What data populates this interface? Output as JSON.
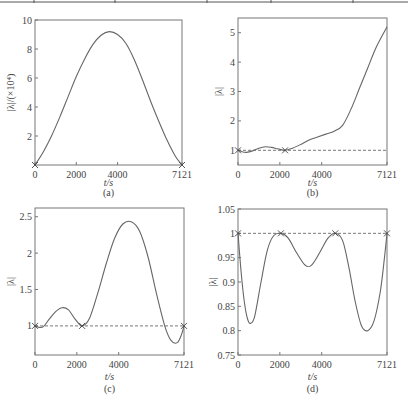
{
  "figure": {
    "top_table_rule": true
  },
  "chart_data": [
    {
      "id": "a",
      "type": "line",
      "panel_label": "(a)",
      "title": "",
      "xlabel": "t/s",
      "ylabel": "|λ|/(×10⁴)",
      "xlim": [
        0,
        7121
      ],
      "ylim": [
        0,
        10
      ],
      "xticks": [
        0,
        2000,
        4000,
        7121
      ],
      "xtick_labels": [
        "0",
        "2000",
        "4000",
        "7121"
      ],
      "yticks": [
        2,
        4,
        6,
        8,
        10
      ],
      "ytick_labels": [
        "2",
        "4",
        "6",
        "8",
        "10"
      ],
      "grid": false,
      "reference_line": null,
      "markers": [
        {
          "x": 0,
          "y": 0
        },
        {
          "x": 7121,
          "y": 0
        }
      ],
      "series": [
        {
          "name": "|λ|",
          "x": [
            0,
            400,
            800,
            1200,
            1600,
            2000,
            2400,
            2800,
            3200,
            3600,
            4000,
            4400,
            4800,
            5200,
            5600,
            6000,
            6400,
            6800,
            7121
          ],
          "y": [
            0,
            0.9,
            2.0,
            3.3,
            4.7,
            6.1,
            7.3,
            8.3,
            8.95,
            9.2,
            9.0,
            8.4,
            7.3,
            5.9,
            4.4,
            3.0,
            1.7,
            0.6,
            0
          ]
        }
      ]
    },
    {
      "id": "b",
      "type": "line",
      "panel_label": "(b)",
      "title": "",
      "xlabel": "t/s",
      "ylabel": "|λ|",
      "xlim": [
        0,
        7121
      ],
      "ylim": [
        0.5,
        5.5
      ],
      "xticks": [
        0,
        2000,
        4000,
        7121
      ],
      "xtick_labels": [
        "0",
        "2000",
        "4000",
        "7121"
      ],
      "yticks": [
        1,
        2,
        3,
        4,
        5
      ],
      "ytick_labels": [
        "1",
        "2",
        "3",
        "4",
        "5"
      ],
      "grid": false,
      "reference_line": 1,
      "markers": [
        {
          "x": 0,
          "y": 1
        },
        {
          "x": 2250,
          "y": 1
        }
      ],
      "series": [
        {
          "name": "|λ|",
          "x": [
            0,
            200,
            400,
            700,
            1000,
            1300,
            1600,
            1900,
            2250,
            2600,
            3000,
            3400,
            3800,
            4200,
            4600,
            5000,
            5400,
            5800,
            6200,
            6600,
            7121
          ],
          "y": [
            1.0,
            0.95,
            0.93,
            0.98,
            1.07,
            1.12,
            1.1,
            1.05,
            1.0,
            1.07,
            1.2,
            1.35,
            1.45,
            1.55,
            1.65,
            1.85,
            2.4,
            3.1,
            3.8,
            4.5,
            5.2
          ]
        }
      ]
    },
    {
      "id": "c",
      "type": "line",
      "panel_label": "(c)",
      "title": "",
      "xlabel": "t/s",
      "ylabel": "|λ|",
      "xlim": [
        0,
        7121
      ],
      "ylim": [
        0.6,
        2.62
      ],
      "xticks": [
        0,
        2000,
        4000,
        7121
      ],
      "xtick_labels": [
        "0",
        "2000",
        "4000",
        "7121"
      ],
      "yticks": [
        1,
        1.5,
        2,
        2.5
      ],
      "ytick_labels": [
        "1",
        "1.5",
        "2",
        "2.5"
      ],
      "grid": false,
      "reference_line": 1,
      "markers": [
        {
          "x": 0,
          "y": 1
        },
        {
          "x": 2250,
          "y": 1
        },
        {
          "x": 7121,
          "y": 1
        }
      ],
      "series": [
        {
          "name": "|λ|",
          "x": [
            0,
            200,
            400,
            700,
            1000,
            1300,
            1600,
            1900,
            2250,
            2600,
            3000,
            3400,
            3800,
            4200,
            4600,
            5000,
            5400,
            5800,
            6200,
            6500,
            6800,
            7000,
            7121
          ],
          "y": [
            1.0,
            0.98,
            0.99,
            1.1,
            1.2,
            1.25,
            1.22,
            1.1,
            1.0,
            1.1,
            1.45,
            1.85,
            2.2,
            2.4,
            2.43,
            2.3,
            1.95,
            1.45,
            1.0,
            0.8,
            0.77,
            0.88,
            1.0
          ]
        }
      ]
    },
    {
      "id": "d",
      "type": "line",
      "panel_label": "(d)",
      "title": "",
      "xlabel": "t/s",
      "ylabel": "|λ|",
      "xlim": [
        0,
        7121
      ],
      "ylim": [
        0.75,
        1.05
      ],
      "xticks": [
        0,
        2000,
        4000,
        7121
      ],
      "xtick_labels": [
        "0",
        "2000",
        "4000",
        "7121"
      ],
      "yticks": [
        0.75,
        0.8,
        0.85,
        0.9,
        0.95,
        1,
        1.05
      ],
      "ytick_labels": [
        "0.75",
        "0.8",
        "0.85",
        "0.9",
        "0.95",
        "1",
        "1.05"
      ],
      "grid": false,
      "reference_line": 1,
      "markers": [
        {
          "x": 0,
          "y": 1
        },
        {
          "x": 2050,
          "y": 1
        },
        {
          "x": 4650,
          "y": 1
        },
        {
          "x": 7121,
          "y": 1
        }
      ],
      "series": [
        {
          "name": "|λ|",
          "x": [
            0,
            150,
            300,
            450,
            600,
            800,
            1100,
            1400,
            1700,
            2050,
            2400,
            2800,
            3200,
            3500,
            3900,
            4300,
            4650,
            5000,
            5300,
            5600,
            5900,
            6200,
            6500,
            6800,
            7000,
            7121
          ],
          "y": [
            1.0,
            0.92,
            0.86,
            0.825,
            0.815,
            0.83,
            0.9,
            0.965,
            0.995,
            1.0,
            0.99,
            0.96,
            0.935,
            0.934,
            0.96,
            0.99,
            1.0,
            0.985,
            0.93,
            0.86,
            0.81,
            0.8,
            0.82,
            0.88,
            0.95,
            1.0
          ]
        }
      ]
    }
  ]
}
